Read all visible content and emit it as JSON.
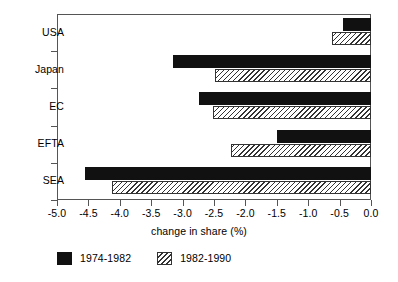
{
  "chart_data": {
    "type": "bar",
    "orientation": "horizontal",
    "title": "",
    "subtitle": "",
    "xlabel": "change in share (%)",
    "ylabel": "",
    "categories": [
      "USA",
      "Japan",
      "EC",
      "EFTA",
      "SEA"
    ],
    "series": [
      {
        "name": "1974-1982",
        "style": "solid-black",
        "color": "#111111",
        "values": [
          -0.45,
          -3.15,
          -2.74,
          -1.5,
          -4.55
        ]
      },
      {
        "name": "1982-1990",
        "style": "hatched",
        "color": "#ffffff",
        "values": [
          -0.62,
          -2.48,
          -2.52,
          -2.23,
          -4.12
        ]
      }
    ],
    "xlim": [
      -5.0,
      0.0
    ],
    "xticks": [
      -5.0,
      -4.5,
      -4.0,
      -3.5,
      -3.0,
      -2.5,
      -2.0,
      -1.5,
      -1.0,
      -0.5,
      0.0
    ],
    "xtick_labels": [
      "-5.0",
      "-4.5",
      "-4.0",
      "-3.5",
      "-3.0",
      "-2.5",
      "-2.0",
      "-1.5",
      "-1.0",
      "-0.5",
      "0.0"
    ],
    "grid": false,
    "legend_position": "bottom-left"
  },
  "legend": {
    "items": [
      {
        "label": "1974-1982",
        "swatch": "solid-black-swatch"
      },
      {
        "label": "1982-1990",
        "swatch": "hatched-swatch"
      }
    ]
  },
  "axis": {
    "x_title": "change in share (%)"
  },
  "colors": {
    "series_1": "#111111",
    "series_2": "#ffffff",
    "axis": "#555555",
    "background": "#ffffff"
  }
}
